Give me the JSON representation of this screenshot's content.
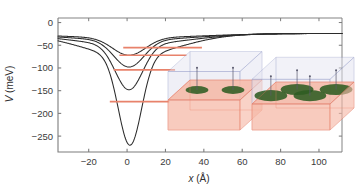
{
  "figure": {
    "background": "#ffffff",
    "axis_color": "#7d7d7d",
    "curve_color": "#2b2b2b",
    "level_color": "#e8826b",
    "box_edge_color": "#e8826b",
    "box_edge_top_color": "#8b93c4",
    "box_fill_lower": "#f6b8a6",
    "box_fill_upper": "#e3e3f0",
    "disk_color": "#2f5c22",
    "pin_color": "#5a5a6e"
  },
  "axes": {
    "x": {
      "label_var": "x",
      "label_unit": "(Å)",
      "ticks": [
        -20,
        0,
        20,
        40,
        60,
        80,
        100
      ],
      "tick_labels": [
        "−20",
        "0",
        "20",
        "40",
        "60",
        "80",
        "100"
      ],
      "min": -36,
      "max": 112
    },
    "y": {
      "label_var": "V",
      "label_unit": "(meV)",
      "ticks": [
        0,
        -50,
        -100,
        -150,
        -200,
        -250
      ],
      "tick_labels": [
        "0",
        "−50",
        "−100",
        "−150",
        "−200",
        "−250"
      ],
      "min": -285,
      "max": 10
    }
  },
  "chart_data": {
    "type": "line",
    "title": "",
    "xlabel": "x (Å)",
    "ylabel": "V (meV)",
    "xlim": [
      -36,
      112
    ],
    "ylim": [
      -285,
      10
    ],
    "grid": false,
    "legend": "none",
    "series": [
      {
        "name": "well-1-shallowest",
        "color": "#2b2b2b",
        "depth_meV": -72,
        "center_A": 1.0,
        "width_A": 12.0,
        "asymptote_meV": -24,
        "energy_level_meV": -55,
        "level_x_start_A": -2,
        "level_x_end_A": 39
      },
      {
        "name": "well-2",
        "color": "#2b2b2b",
        "depth_meV": -98,
        "center_A": 1.0,
        "width_A": 11.0,
        "asymptote_meV": -24,
        "energy_level_meV": -72,
        "level_x_start_A": -4,
        "level_x_end_A": 31
      },
      {
        "name": "well-3",
        "color": "#2b2b2b",
        "depth_meV": -148,
        "center_A": 1.0,
        "width_A": 10.0,
        "asymptote_meV": -24,
        "energy_level_meV": -104,
        "level_x_start_A": -7,
        "level_x_end_A": 25
      },
      {
        "name": "well-4-deepest",
        "color": "#2b2b2b",
        "depth_meV": -270,
        "center_A": 1.5,
        "width_A": 8.5,
        "asymptote_meV": -24,
        "energy_level_meV": -174,
        "level_x_start_A": -9,
        "level_x_end_A": 22
      }
    ]
  },
  "insets": {
    "left": {
      "name": "two-dot-schematic",
      "disk_count": 2,
      "pin_count": 2,
      "disk_radius_rel": 0.16
    },
    "right": {
      "name": "four-dot-schematic",
      "disk_count": 4,
      "pin_count": 4,
      "disk_radius_rel": 0.21
    }
  }
}
